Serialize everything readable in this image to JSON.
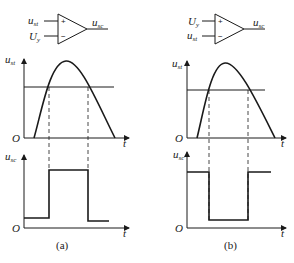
{
  "figure": {
    "panels": [
      {
        "id": "a",
        "caption": "(a)",
        "opamp": {
          "plus_input": {
            "main": "u",
            "sub": "st"
          },
          "minus_input": {
            "main": "U",
            "sub": "y"
          },
          "plus_sign": "+",
          "minus_sign": "−",
          "output": {
            "main": "u",
            "sub": "sc"
          }
        },
        "input_plot": {
          "ylabel": {
            "main": "u",
            "sub": "st"
          },
          "origin": "O",
          "xlabel": "t"
        },
        "output_plot": {
          "ylabel": {
            "main": "u",
            "sub": "sc"
          },
          "origin": "O",
          "xlabel": "t",
          "pattern": "low-high-low"
        }
      },
      {
        "id": "b",
        "caption": "(b)",
        "opamp": {
          "plus_input": {
            "main": "U",
            "sub": "y"
          },
          "minus_input": {
            "main": "u",
            "sub": "st"
          },
          "plus_sign": "+",
          "minus_sign": "−",
          "output": {
            "main": "u",
            "sub": "sc"
          }
        },
        "input_plot": {
          "ylabel": {
            "main": "u",
            "sub": "st"
          },
          "origin": "O",
          "xlabel": "t"
        },
        "output_plot": {
          "ylabel": {
            "main": "u",
            "sub": "sc"
          },
          "origin": "O",
          "xlabel": "t",
          "pattern": "high-low-high"
        }
      }
    ]
  }
}
